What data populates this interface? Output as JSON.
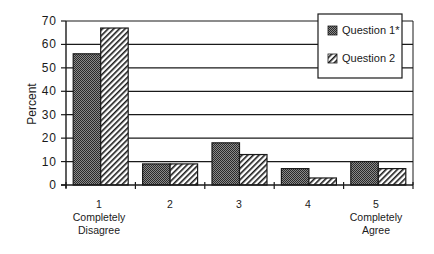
{
  "chart_data": {
    "type": "bar",
    "title": "",
    "xlabel": "",
    "ylabel": "Percent",
    "ylim": [
      0,
      70
    ],
    "yticks": [
      0,
      10,
      20,
      30,
      40,
      50,
      60,
      70
    ],
    "grid": "horizontal",
    "legend_position": "top-right (inside)",
    "categories": [
      "1",
      "2",
      "3",
      "4",
      "5"
    ],
    "category_sublabels": [
      [
        "Completely",
        "Disagree"
      ],
      [],
      [],
      [],
      [
        "Completely",
        "Agree"
      ]
    ],
    "series": [
      {
        "name": "Question 1*",
        "pattern": "dark-checker",
        "values": [
          56,
          9,
          18,
          7,
          10
        ]
      },
      {
        "name": "Question 2",
        "pattern": "diagonal-hatch",
        "values": [
          67,
          9,
          13,
          3,
          7
        ]
      }
    ]
  },
  "labels": {
    "ylabel": "Percent",
    "legend": [
      "Question 1*",
      "Question 2"
    ],
    "cats": [
      "1",
      "2",
      "3",
      "4",
      "5"
    ],
    "cat1_line1": "Completely",
    "cat1_line2": "Disagree",
    "cat5_line1": "Completely",
    "cat5_line2": "Agree"
  },
  "colors": {
    "ink": "#1a1a1a",
    "q1_fill": "#555555",
    "background": "#ffffff"
  }
}
